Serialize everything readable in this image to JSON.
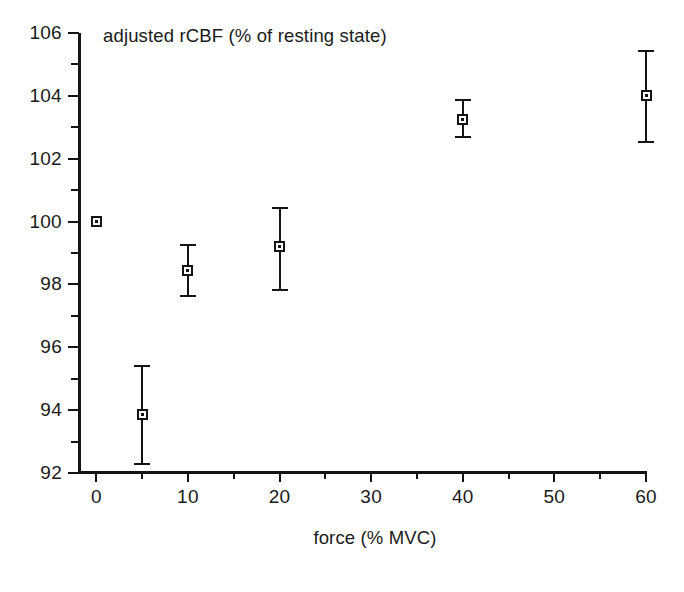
{
  "chart_data": {
    "type": "scatter",
    "title": "adjusted rCBF (% of resting state)",
    "xlabel": "force (% MVC)",
    "ylabel": "",
    "xlim": [
      -2,
      60
    ],
    "ylim": [
      92,
      106
    ],
    "grid": false,
    "legend": "none",
    "x_ticks": [
      "0",
      "10",
      "20",
      "30",
      "40",
      "50",
      "60"
    ],
    "x_tick_values": [
      0,
      10,
      20,
      30,
      40,
      50,
      60
    ],
    "x_minor_ticks": [
      -5,
      5,
      15,
      25,
      35,
      45,
      55
    ],
    "y_ticks": [
      "92",
      "94",
      "96",
      "98",
      "100",
      "102",
      "104",
      "106"
    ],
    "y_tick_values": [
      92,
      94,
      96,
      98,
      100,
      102,
      104,
      106
    ],
    "y_minor_ticks": [
      93,
      95,
      97,
      99,
      101,
      103,
      105
    ],
    "series": [
      {
        "name": "adjusted rCBF",
        "marker": "open-square",
        "points": [
          {
            "x": 0,
            "y": 100.0,
            "err_low": 100.0,
            "err_high": 100.0
          },
          {
            "x": 5,
            "y": 93.85,
            "err_low": 92.25,
            "err_high": 95.45
          },
          {
            "x": 10,
            "y": 98.45,
            "err_low": 97.6,
            "err_high": 99.3
          },
          {
            "x": 20,
            "y": 99.2,
            "err_low": 97.8,
            "err_high": 100.45
          },
          {
            "x": 40,
            "y": 103.25,
            "err_low": 102.65,
            "err_high": 103.9
          },
          {
            "x": 60,
            "y": 104.0,
            "err_low": 102.5,
            "err_high": 105.45
          }
        ]
      }
    ]
  },
  "colors": {
    "ink": "#141414",
    "background": "#ffffff"
  }
}
